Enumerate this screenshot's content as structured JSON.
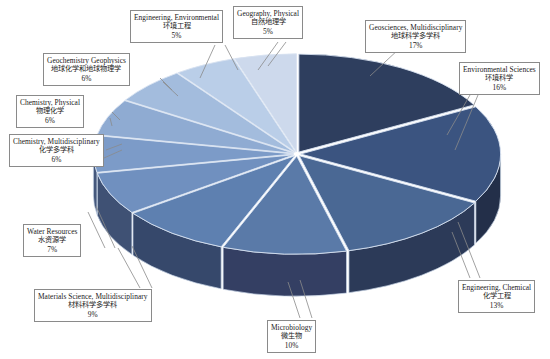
{
  "chart_data": {
    "type": "pie",
    "title": "",
    "subtitle": "",
    "xlabel": "",
    "ylabel": "",
    "legend_position": "callout-labels",
    "grid": false,
    "style": "3d-exploded-pie",
    "start_angle_deg": 0,
    "direction": "clockwise",
    "categories": [
      "Geosciences, Multidisciplinary",
      "Environmental Sciences",
      "Engineering, Chemical",
      "Microbiology",
      "Materials Science, Multidisciplinary",
      "Water Resources",
      "Chemistry, Multidisciplinary",
      "Chemistry, Physical",
      "Geochemistry Geophysics",
      "Engineering, Environmental",
      "Geography, Physical"
    ],
    "values": [
      17,
      16,
      13,
      10,
      9,
      7,
      6,
      6,
      6,
      5,
      5
    ],
    "labels_zh": [
      "地球科学多学科",
      "环境科学",
      "化学工程",
      "微生物",
      "材料科学多学科",
      "水资源学",
      "化学多学科",
      "物理化学",
      "地球化学和地球物理学",
      "环境工程",
      "自然地理学"
    ],
    "percent_labels": [
      "17%",
      "16%",
      "13%",
      "10%",
      "9%",
      "7%",
      "6%",
      "6%",
      "6%",
      "5%",
      "5%"
    ],
    "colors": [
      "#2e3e5e",
      "#3b5480",
      "#4a6894",
      "#5a7aa8",
      "#5e80b0",
      "#7090bf",
      "#7c9bc8",
      "#8fabd2",
      "#a3bcdd",
      "#bacee8",
      "#cdd9ec"
    ],
    "side_colors": [
      "#1b2438",
      "#232f49",
      "#2c3a58",
      "#343f63",
      "#36486b",
      "#3f5174",
      "#45587c",
      "#4d6086",
      "#566a8f",
      "#627699",
      "#6c7fa2"
    ]
  },
  "slices": [
    {
      "id": "geosciences-multidisciplinary",
      "en": "Geosciences, Multidisciplinary",
      "zh": "地球科学多学科",
      "pct": "17%",
      "value": 17,
      "color": "#2e3e5e"
    },
    {
      "id": "environmental-sciences",
      "en": "Environmental Sciences",
      "zh": "环境科学",
      "pct": "16%",
      "value": 16,
      "color": "#3b5480"
    },
    {
      "id": "engineering-chemical",
      "en": "Engineering, Chemical",
      "zh": "化学工程",
      "pct": "13%",
      "value": 13,
      "color": "#4a6894"
    },
    {
      "id": "microbiology",
      "en": "Microbiology",
      "zh": "微生物",
      "pct": "10%",
      "value": 10,
      "color": "#5a7aa8"
    },
    {
      "id": "materials-science-multidisciplinary",
      "en": "Materials Science, Multidisciplinary",
      "zh": "材料科学多学科",
      "pct": "9%",
      "value": 9,
      "color": "#5e80b0"
    },
    {
      "id": "water-resources",
      "en": "Water Resources",
      "zh": "水资源学",
      "pct": "7%",
      "value": 7,
      "color": "#7090bf"
    },
    {
      "id": "chemistry-multidisciplinary",
      "en": "Chemistry, Multidisciplinary",
      "zh": "化学多学科",
      "pct": "6%",
      "value": 6,
      "color": "#7c9bc8"
    },
    {
      "id": "chemistry-physical",
      "en": "Chemistry, Physical",
      "zh": "物理化学",
      "pct": "6%",
      "value": 6,
      "color": "#8fabd2"
    },
    {
      "id": "geochemistry-geophysics",
      "en": "Geochemistry Geophysics",
      "zh": "地球化学和地球物理学",
      "pct": "6%",
      "value": 6,
      "color": "#a3bcdd"
    },
    {
      "id": "engineering-environmental",
      "en": "Engineering, Environmental",
      "zh": "环境工程",
      "pct": "5%",
      "value": 5,
      "color": "#bacee8"
    },
    {
      "id": "geography-physical",
      "en": "Geography, Physical",
      "zh": "自然地理学",
      "pct": "5%",
      "value": 5,
      "color": "#cdd9ec"
    }
  ]
}
